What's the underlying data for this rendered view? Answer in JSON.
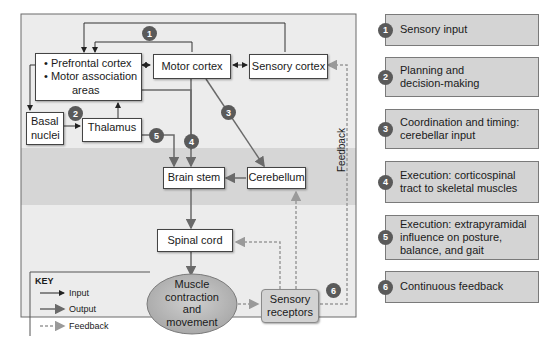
{
  "diagram": {
    "nodes": {
      "prefrontal": {
        "line1": "• Prefrontal cortex",
        "line2": "• Motor association",
        "line3": "areas"
      },
      "motor_cortex": "Motor cortex",
      "sensory_cortex": "Sensory cortex",
      "basal_nuclei": {
        "line1": "Basal",
        "line2": "nuclei"
      },
      "thalamus": "Thalamus",
      "brain_stem": "Brain stem",
      "cerebellum": "Cerebellum",
      "spinal_cord": "Spinal cord",
      "muscle": {
        "line1": "Muscle",
        "line2": "contraction",
        "line3": "and",
        "line4": "movement"
      },
      "sensory_receptors": {
        "line1": "Sensory",
        "line2": "receptors"
      }
    },
    "badges": [
      "1",
      "2",
      "3",
      "4",
      "5",
      "6"
    ],
    "feedback_label": "Feedback",
    "key": {
      "title": "KEY",
      "items": [
        "Input",
        "Output",
        "Feedback"
      ]
    },
    "colors": {
      "panel_bg": "#ececec",
      "band_bg": "#d6d6d6",
      "badge": "#5a5a5a",
      "legend_card": "#d4d4d4",
      "ellipse": "#bdbdbd"
    }
  },
  "legend": [
    {
      "num": "1",
      "text": "Sensory input"
    },
    {
      "num": "2",
      "text": "Planning and decision-making"
    },
    {
      "num": "3",
      "text": "Coordination and timing: cerebellar input"
    },
    {
      "num": "4",
      "text": "Execution: corticospinal tract to skeletal muscles"
    },
    {
      "num": "5",
      "text": "Execution: extrapyramidal influence on posture, balance, and gait"
    },
    {
      "num": "6",
      "text": "Continuous feedback"
    }
  ]
}
